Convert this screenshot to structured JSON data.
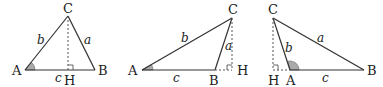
{
  "diagram": {
    "title": "",
    "triangles": [
      {
        "id": "acute",
        "vertices": {
          "A": "A",
          "B": "B",
          "C": "C",
          "H": "H"
        },
        "sides": {
          "a": "a",
          "b": "b",
          "c": "c"
        }
      },
      {
        "id": "obtuse-at-B",
        "vertices": {
          "A": "A",
          "B": "B",
          "C": "C",
          "H": "H"
        },
        "sides": {
          "a": "a",
          "b": "b",
          "c": "c"
        }
      },
      {
        "id": "obtuse-at-A",
        "vertices": {
          "A": "A",
          "B": "B",
          "C": "C",
          "H": "H"
        },
        "sides": {
          "a": "a",
          "b": "b",
          "c": "c"
        }
      }
    ],
    "colors": {
      "stroke": "#333333",
      "angle_fill": "#aaaaaa",
      "background": "#ffffff"
    }
  }
}
